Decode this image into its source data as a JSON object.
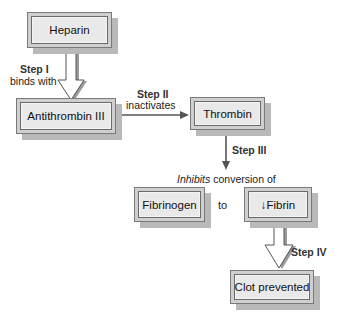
{
  "nodes": {
    "heparin": "Heparin",
    "antithrombin": "Antithrombin III",
    "thrombin": "Thrombin",
    "fibrinogen": "Fibrinogen",
    "fibrin": "↓Fibrin",
    "clot": "Clot prevented"
  },
  "steps": {
    "step1_title": "Step I",
    "step1_desc": "binds with",
    "step2_title": "Step II",
    "step2_desc": "inactivates",
    "step3_title": "Step III",
    "step4_title": "Step IV"
  },
  "conversion": {
    "inhibits": "Inhibits",
    "rest": " conversion of",
    "to": "to"
  },
  "colors": {
    "box_outer": "#cfcfcf",
    "box_inner": "#e9e9e9",
    "shadow": "#b9b9b9",
    "line": "#555555"
  }
}
